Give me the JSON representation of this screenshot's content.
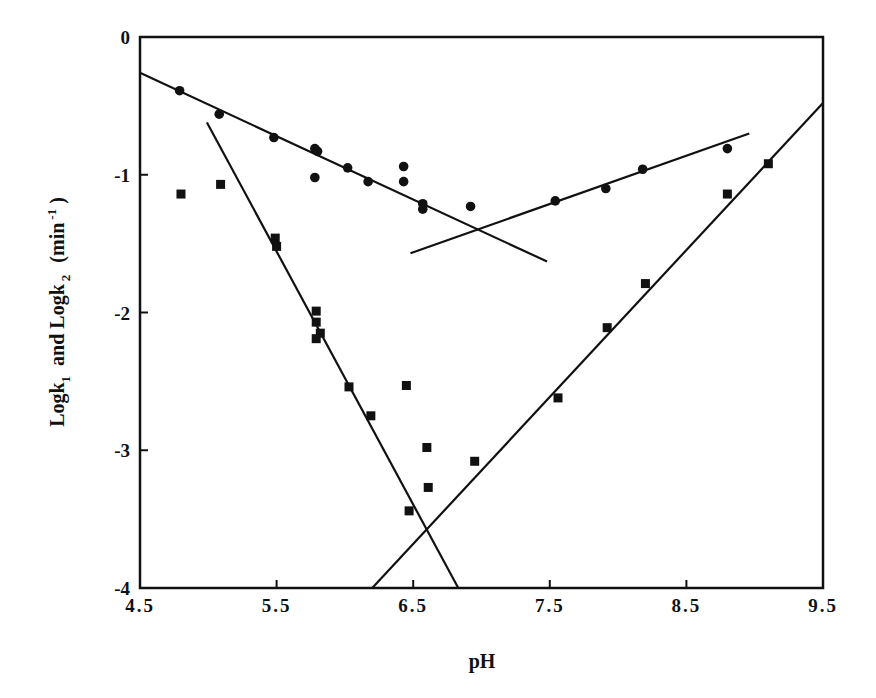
{
  "chart_data": {
    "type": "scatter",
    "title": "",
    "xlabel": "pH",
    "ylabel": "Logk 1 and Logk 2 (min -1 )",
    "ylabel_parts": {
      "a": "Logk",
      "a_sub": "1",
      "mid": "and Logk",
      "b_sub": "2",
      "unit_open": "(min",
      "unit_sup": "-1",
      "unit_close": ")"
    },
    "xlim": [
      4.5,
      9.5
    ],
    "ylim": [
      -4,
      0
    ],
    "x_ticks": [
      "4.5",
      "5.5",
      "6.5",
      "7.5",
      "8.5",
      "9.5"
    ],
    "y_ticks": [
      "0",
      "-1",
      "-2",
      "-3",
      "-4"
    ],
    "grid": false,
    "legend": null,
    "series": [
      {
        "name": "Logk1",
        "marker": "circle",
        "points": [
          [
            4.79,
            -0.39
          ],
          [
            5.08,
            -0.56
          ],
          [
            5.48,
            -0.73
          ],
          [
            5.78,
            -0.81
          ],
          [
            5.8,
            -0.83
          ],
          [
            5.78,
            -1.02
          ],
          [
            6.02,
            -0.95
          ],
          [
            6.17,
            -1.05
          ],
          [
            6.43,
            -0.94
          ],
          [
            6.43,
            -1.05
          ],
          [
            6.57,
            -1.21
          ],
          [
            6.57,
            -1.25
          ],
          [
            6.92,
            -1.23
          ],
          [
            7.54,
            -1.19
          ],
          [
            7.91,
            -1.1
          ],
          [
            8.18,
            -0.96
          ],
          [
            8.8,
            -0.81
          ]
        ]
      },
      {
        "name": "Logk2",
        "marker": "square",
        "points": [
          [
            4.8,
            -1.14
          ],
          [
            5.09,
            -1.07
          ],
          [
            5.49,
            -1.46
          ],
          [
            5.5,
            -1.52
          ],
          [
            5.79,
            -1.99
          ],
          [
            5.79,
            -2.07
          ],
          [
            5.82,
            -2.15
          ],
          [
            5.79,
            -2.19
          ],
          [
            6.03,
            -2.54
          ],
          [
            6.19,
            -2.75
          ],
          [
            6.45,
            -2.53
          ],
          [
            6.6,
            -2.98
          ],
          [
            6.61,
            -3.27
          ],
          [
            6.47,
            -3.44
          ],
          [
            6.95,
            -3.08
          ],
          [
            7.56,
            -2.62
          ],
          [
            7.92,
            -2.11
          ],
          [
            8.2,
            -1.79
          ],
          [
            8.8,
            -1.14
          ],
          [
            9.1,
            -0.92
          ]
        ]
      }
    ],
    "fit_lines": [
      {
        "name": "Logk1 acidic fit",
        "from": [
          4.5,
          -0.26
        ],
        "to": [
          7.48,
          -1.63
        ]
      },
      {
        "name": "Logk1 basic fit",
        "from": [
          6.48,
          -1.57
        ],
        "to": [
          8.96,
          -0.7
        ]
      },
      {
        "name": "Logk2 acidic fit",
        "from": [
          4.99,
          -0.62
        ],
        "to": [
          6.83,
          -4.0
        ]
      },
      {
        "name": "Logk2 basic fit",
        "from": [
          6.2,
          -4.0
        ],
        "to": [
          9.5,
          -0.48
        ]
      }
    ]
  }
}
